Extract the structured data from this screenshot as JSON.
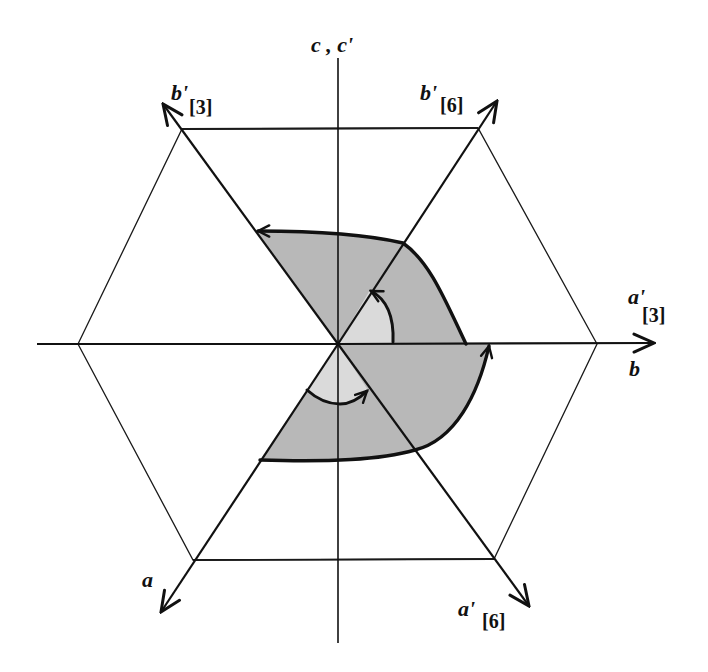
{
  "figure": {
    "type": "crystallographic axes diagram",
    "colors": {
      "line": "#111111",
      "shade_outer": "#b8b8b8",
      "shade_inner": "#d9d9d9",
      "background": "#ffffff"
    },
    "labels": {
      "c_axis": "c , c'",
      "b_prime_3": {
        "main": "b'",
        "sub": "[3]"
      },
      "b_prime_6": {
        "main": "b'",
        "sub": "[6]"
      },
      "a_prime_3": {
        "main": "a'",
        "sub": "[3]"
      },
      "b_axis": "b",
      "a_axis": "a",
      "a_prime_6": {
        "main": "a'",
        "sub": "[6]"
      }
    },
    "elements": {
      "hexagon": "regular-like hexagon centered at origin",
      "axes": [
        "horizontal b axis",
        "vertical c axis",
        "a / b'[6] diagonal",
        "a'[6] / b'[3] diagonal"
      ],
      "shaded_regions": [
        "upper sector (b'[3] to a'[3])",
        "lower sector (a'[3] to a)"
      ],
      "rotation_arrows": [
        "60° rotation arrow upper",
        "60° rotation arrow lower"
      ]
    }
  }
}
